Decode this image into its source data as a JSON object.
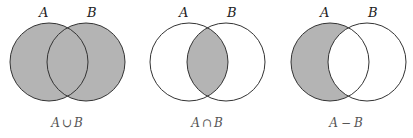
{
  "colors": {
    "shade": "#b4b4b4",
    "stroke": "#333333",
    "background": "#ffffff"
  },
  "diagrams": [
    {
      "name": "union",
      "set_a_label": "A",
      "set_b_label": "B",
      "caption_left": "A",
      "caption_op": "∪",
      "caption_right": "B",
      "shaded_region": "A ∪ B"
    },
    {
      "name": "intersection",
      "set_a_label": "A",
      "set_b_label": "B",
      "caption_left": "A",
      "caption_op": "∩",
      "caption_right": "B",
      "shaded_region": "A ∩ B"
    },
    {
      "name": "difference",
      "set_a_label": "A",
      "set_b_label": "B",
      "caption_left": "A",
      "caption_op": "−",
      "caption_right": "B",
      "shaded_region": "A − B"
    }
  ]
}
